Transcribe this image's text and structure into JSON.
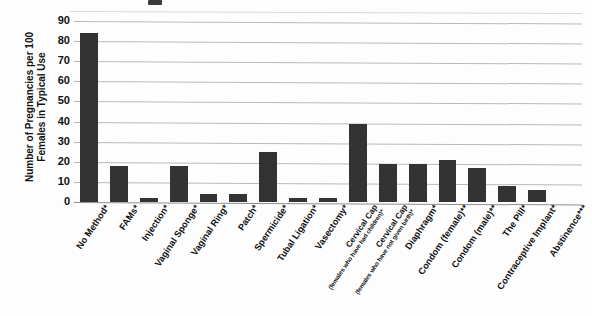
{
  "chart_data": {
    "type": "bar",
    "title": "",
    "xlabel": "",
    "ylabel": "Number of Pregnancies per 100 Females in Typical Use",
    "ylim": [
      0,
      90
    ],
    "yticks": [
      0,
      10,
      20,
      30,
      40,
      50,
      60,
      70,
      80,
      90
    ],
    "grid": true,
    "legend": "none",
    "orientation": "vertical",
    "bar_color": "#333333",
    "categories": [
      "No Method*",
      "FAMs*",
      "Injection*",
      "Vaginal Sponge*",
      "Vaginal Ring*",
      "Patch*",
      "Spermicide*",
      "Tubal Ligation*",
      "Vasectomy*",
      "Cervical Cap (females who have had children)*",
      "Cervical Cap (females who have not given birth)*",
      "Diaphragm*",
      "Condom (female)**",
      "Condom (male)**",
      "The Pill*",
      "Contraceptive Implant*",
      "Abstinence***"
    ],
    "values": [
      84,
      18,
      2,
      18,
      4,
      4,
      25,
      2,
      2,
      39,
      19,
      19,
      21,
      17,
      8,
      6,
      0
    ],
    "categories_display": [
      {
        "main": "No Method*",
        "sub": ""
      },
      {
        "main": "FAMs*",
        "sub": ""
      },
      {
        "main": "Injection*",
        "sub": ""
      },
      {
        "main": "Vaginal Sponge*",
        "sub": ""
      },
      {
        "main": "Vaginal Ring*",
        "sub": ""
      },
      {
        "main": "Patch*",
        "sub": ""
      },
      {
        "main": "Spermicide*",
        "sub": ""
      },
      {
        "main": "Tubal Ligation*",
        "sub": ""
      },
      {
        "main": "Vasectomy*",
        "sub": ""
      },
      {
        "main": "Cervical Cap",
        "sub": "(females who have had children)*"
      },
      {
        "main": "Cervical Cap",
        "sub": "(females who have not given birth)*"
      },
      {
        "main": "Diaphragm*",
        "sub": ""
      },
      {
        "main": "Condom (female)**",
        "sub": ""
      },
      {
        "main": "Condom (male)**",
        "sub": ""
      },
      {
        "main": "The Pill*",
        "sub": ""
      },
      {
        "main": "Contraceptive Implant*",
        "sub": ""
      },
      {
        "main": "Abstinence***",
        "sub": ""
      }
    ]
  },
  "axis": {
    "y_title": "Number of Pregnancies per 100 Females in Typical Use",
    "y_tick_labels": [
      "90",
      "80",
      "70",
      "60",
      "50",
      "40",
      "30",
      "20",
      "10",
      "0"
    ]
  }
}
